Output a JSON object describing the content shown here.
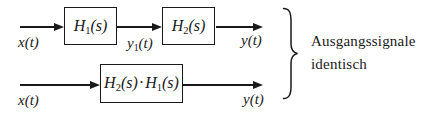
{
  "diagram": {
    "series_system": {
      "input_label": "x(t)",
      "block1": {
        "base": "H",
        "sub": "1",
        "arg": "(s)"
      },
      "intermediate_label": {
        "base": "y",
        "sub": "1",
        "arg": "(t)"
      },
      "block2": {
        "base": "H",
        "sub": "2",
        "arg": "(s)"
      },
      "output_label": "y(t)"
    },
    "combined_system": {
      "input_label": "x(t)",
      "block": {
        "factor1": {
          "base": "H",
          "sub": "2",
          "arg": "(s)"
        },
        "dot": "·",
        "factor2": {
          "base": "H",
          "sub": "1",
          "arg": "(s)"
        }
      },
      "output_label": "y(t)"
    },
    "annotation": {
      "line1": "Ausgangssignale",
      "line2": "identisch"
    }
  },
  "colors": {
    "stroke": "#1a1a1a",
    "background": "#ffffff"
  }
}
